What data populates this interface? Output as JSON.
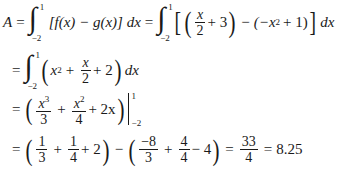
{
  "equation": {
    "lhs": "A",
    "eq": "=",
    "integral_upper": "1",
    "integral_lower": "−2",
    "line1_expr": "[f(x) − g(x)] dx",
    "line1b": {
      "x_over": "x",
      "den2": "2",
      "plus3": "+ 3",
      "minus": "−",
      "g_part_open": "(−x",
      "exp2": "2",
      "g_part_close": "+ 1)",
      "dx": "dx"
    },
    "line2": {
      "x": "x",
      "exp2": "2",
      "plus": "+",
      "frac_num": "x",
      "frac_den": "2",
      "plus2": "+ 2",
      "dx": "dx"
    },
    "line3": {
      "f1_num_base": "x",
      "f1_num_exp": "3",
      "f1_den": "3",
      "plus": "+",
      "f2_num_base": "x",
      "f2_num_exp": "2",
      "f2_den": "4",
      "plus2x": "+ 2x",
      "eval_upper": "1",
      "eval_lower": "−2"
    },
    "line4": {
      "a_num": "1",
      "a_den": "3",
      "plus": "+",
      "b_num": "1",
      "b_den": "4",
      "plus2": "+ 2",
      "minus": "−",
      "c_num": "−8",
      "c_den": "3",
      "d_num": "4",
      "d_den": "4",
      "minus4": "− 4",
      "r_num": "33",
      "r_den": "4",
      "result": "8.25"
    }
  }
}
